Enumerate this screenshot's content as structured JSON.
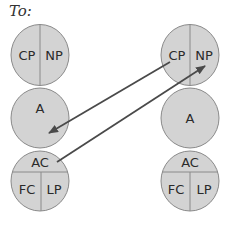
{
  "title": "To:",
  "colors": {
    "fill": "#d3d3d3",
    "stroke": "#8a8a8a",
    "arrow": "#4a4a4a",
    "text": "#2a2a2a"
  },
  "columns": [
    {
      "id": "left",
      "top": {
        "left_label": "CP",
        "right_label": "NP"
      },
      "middle": {
        "label": "A"
      },
      "bottom": {
        "top_label": "AC",
        "left_label": "FC",
        "right_label": "LP"
      }
    },
    {
      "id": "right",
      "top": {
        "left_label": "CP",
        "right_label": "NP"
      },
      "middle": {
        "label": "A"
      },
      "bottom": {
        "top_label": "AC",
        "left_label": "FC",
        "right_label": "LP"
      }
    }
  ],
  "arrows": [
    {
      "from": "right CP",
      "to": "left A"
    },
    {
      "from": "left AC",
      "to": "right NP"
    }
  ]
}
